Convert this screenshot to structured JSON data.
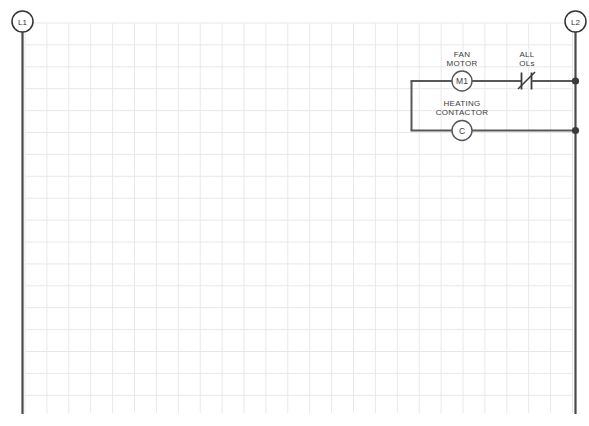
{
  "diagram": {
    "type": "ladder-diagram"
  },
  "rails": {
    "left": {
      "terminal_label": "L1",
      "name": "left-power-rail"
    },
    "right": {
      "terminal_label": "L2",
      "name": "right-power-rail"
    }
  },
  "rungs": [
    {
      "id": "rung-1",
      "device_label_line1": "FAN",
      "device_label_line2": "MOTOR",
      "coil_designation": "M1",
      "contact_label_line1": "ALL",
      "contact_label_line2": "OLs",
      "contact_type": "normally-closed"
    },
    {
      "id": "rung-2",
      "device_label_line1": "HEATING",
      "device_label_line2": "CONTACTOR",
      "coil_designation": "C",
      "contact_label_line1": "",
      "contact_label_line2": "",
      "contact_type": "none"
    }
  ],
  "colors": {
    "grid": "#e8e8e8",
    "rail": "#4a4a4a",
    "wire": "#585858",
    "text": "#3a3a3a",
    "background": "#ffffff"
  }
}
